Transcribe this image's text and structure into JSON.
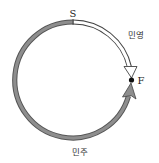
{
  "diagram": {
    "type": "circular-track",
    "circle": {
      "cx": 73,
      "cy": 80,
      "r": 58
    },
    "points": {
      "start": {
        "label": "S",
        "position": "top"
      },
      "finish": {
        "label": "F",
        "position": "right"
      }
    },
    "paths": [
      {
        "name": "민영",
        "direction": "clockwise",
        "from": "S",
        "to": "F",
        "style": "white-outlined-arrow"
      },
      {
        "name": "민주",
        "direction": "counterclockwise",
        "from": "S",
        "to": "F",
        "style": "gray-arrow"
      }
    ],
    "colors": {
      "gray_arrow": "#8a8a8a",
      "outline": "#444444",
      "white_arrow_fill": "#ffffff",
      "dot": "#111111"
    }
  },
  "labels": {
    "start": "S",
    "finish": "F",
    "minyoung": "민영",
    "minju": "민주"
  }
}
